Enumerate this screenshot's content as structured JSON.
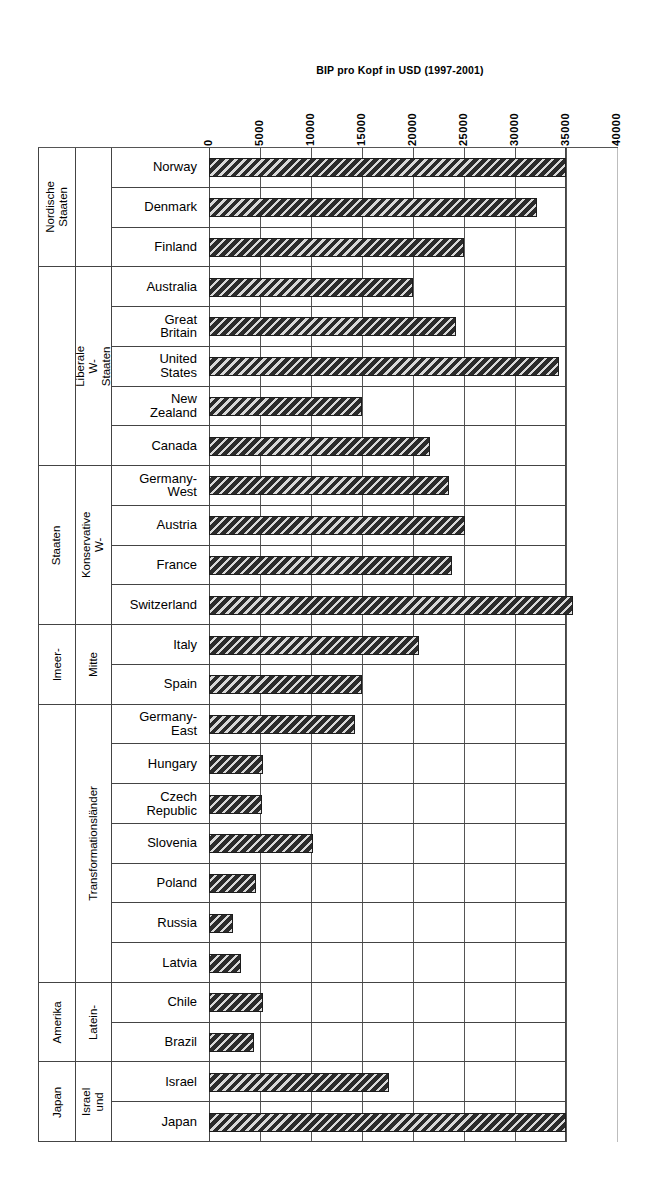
{
  "chart_data": {
    "type": "bar",
    "orientation": "horizontal",
    "title": "BIP pro Kopf in USD (1997-2001)",
    "xlabel": "",
    "ylabel": "",
    "xlim": [
      0,
      40000
    ],
    "xticks": [
      0,
      5000,
      10000,
      15000,
      20000,
      25000,
      30000,
      35000,
      40000
    ],
    "xtick_labels": [
      "0",
      "5000",
      "10000",
      "15000",
      "20000",
      "25000",
      "30000",
      "35000",
      "40000"
    ],
    "grid": true,
    "legend": "none",
    "categories": [
      "Norway",
      "Denmark",
      "Finland",
      "Australia",
      "Great\nBritain",
      "United\nStates",
      "New\nZealand",
      "Canada",
      "Germany-\nWest",
      "Austria",
      "France",
      "Switzerland",
      "Italy",
      "Spain",
      "Germany-\nEast",
      "Hungary",
      "Czech\nRepublic",
      "Slovenia",
      "Poland",
      "Russia",
      "Latvia",
      "Chile",
      "Brazil",
      "Israel",
      "Japan"
    ],
    "values": [
      35000,
      32200,
      25000,
      20000,
      24200,
      34300,
      15000,
      21700,
      23500,
      25100,
      23800,
      35700,
      20600,
      15000,
      14300,
      5300,
      5200,
      10200,
      4600,
      2400,
      3100,
      5300,
      4400,
      17600,
      35000
    ],
    "groups": [
      {
        "outer": "Nordische\nStaaten",
        "inner": "",
        "count": 3
      },
      {
        "outer": "",
        "inner": "Liberale W-Staaten",
        "count": 5
      },
      {
        "outer": "Staaten",
        "inner": "Konservative W-",
        "count": 4
      },
      {
        "outer": "lmeer-",
        "inner": "Mitte",
        "count": 2
      },
      {
        "outer": "",
        "inner": "Transformationsländer",
        "count": 7
      },
      {
        "outer": "Amerika",
        "inner": "Latein-",
        "count": 2
      },
      {
        "outer": "Japan",
        "inner": "Israel und",
        "count": 2
      }
    ],
    "bar_style": {
      "fill": "#2b2b2b",
      "hatch": "diagonal-stripes",
      "edge": "#1c1c1c"
    },
    "axis_color": "#555555",
    "frame_color": "#444444"
  }
}
